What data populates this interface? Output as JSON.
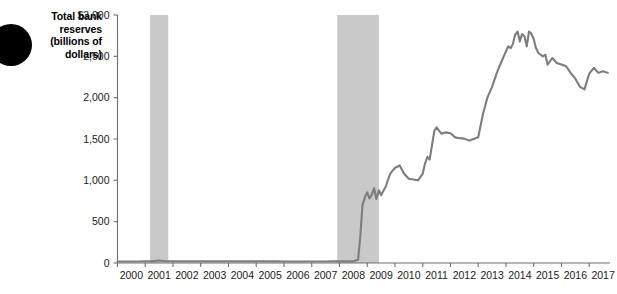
{
  "label": {
    "line1": "Total bank",
    "line2": "reserves",
    "line3": "(billions of",
    "line4": "dollars)",
    "full": "Total bank reserves (billions of dollars)"
  },
  "colors": {
    "line": "#7d7d7d",
    "recession_band": "#c9c9c9",
    "axis": "#6e6e6e",
    "bullet": "#000000",
    "text": "#1a1a1a"
  },
  "chart_data": {
    "type": "line",
    "title": "Total bank reserves (billions of dollars)",
    "xlabel": "",
    "ylabel": "Total bank reserves (billions of dollars)",
    "xlim": [
      2000,
      2017.75
    ],
    "ylim": [
      0,
      3000
    ],
    "grid": false,
    "legend": null,
    "ytick_labels": [
      "$3,000",
      "2,500",
      "2,000",
      "1,500",
      "1,000",
      "500",
      "0"
    ],
    "ytick_values": [
      3000,
      2500,
      2000,
      1500,
      1000,
      500,
      0
    ],
    "xtick_labels": [
      "2000",
      "2001",
      "2002",
      "2003",
      "2004",
      "2005",
      "2006",
      "2007",
      "2008",
      "2009",
      "2010",
      "2011",
      "2012",
      "2013",
      "2014",
      "2015",
      "2016",
      "2017"
    ],
    "xtick_values": [
      2000,
      2001,
      2002,
      2003,
      2004,
      2005,
      2006,
      2007,
      2008,
      2009,
      2010,
      2011,
      2012,
      2013,
      2014,
      2015,
      2016,
      2017
    ],
    "annotations": [
      {
        "name": "recession-2001",
        "type": "vspan",
        "x0": 2001.17,
        "x1": 2001.83,
        "label": "2001 recession"
      },
      {
        "name": "recession-2008",
        "type": "vspan",
        "x0": 2007.92,
        "x1": 2009.42,
        "label": "2007-2009 recession"
      }
    ],
    "series": [
      {
        "name": "Total bank reserves",
        "color": "#7d7d7d",
        "x": [
          2000.0,
          2000.25,
          2000.5,
          2000.75,
          2001.0,
          2001.25,
          2001.5,
          2001.75,
          2002.0,
          2002.25,
          2002.5,
          2002.75,
          2003.0,
          2003.25,
          2003.5,
          2003.75,
          2004.0,
          2004.25,
          2004.5,
          2004.75,
          2005.0,
          2005.25,
          2005.5,
          2005.75,
          2006.0,
          2006.25,
          2006.5,
          2006.75,
          2007.0,
          2007.25,
          2007.5,
          2007.75,
          2008.0,
          2008.25,
          2008.5,
          2008.67,
          2008.75,
          2008.83,
          2008.92,
          2009.0,
          2009.08,
          2009.17,
          2009.25,
          2009.33,
          2009.42,
          2009.5,
          2009.58,
          2009.67,
          2009.75,
          2009.83,
          2009.92,
          2010.0,
          2010.17,
          2010.33,
          2010.5,
          2010.67,
          2010.83,
          2011.0,
          2011.08,
          2011.17,
          2011.25,
          2011.42,
          2011.5,
          2011.67,
          2011.83,
          2012.0,
          2012.17,
          2012.33,
          2012.5,
          2012.67,
          2012.83,
          2013.0,
          2013.17,
          2013.33,
          2013.5,
          2013.67,
          2013.83,
          2014.0,
          2014.08,
          2014.17,
          2014.25,
          2014.33,
          2014.42,
          2014.5,
          2014.58,
          2014.67,
          2014.75,
          2014.83,
          2014.92,
          2015.0,
          2015.08,
          2015.17,
          2015.33,
          2015.42,
          2015.5,
          2015.67,
          2015.83,
          2016.0,
          2016.17,
          2016.33,
          2016.5,
          2016.67,
          2016.83,
          2017.0,
          2017.17,
          2017.33,
          2017.5,
          2017.67
        ],
        "y": [
          18,
          18,
          18,
          18,
          20,
          22,
          30,
          22,
          20,
          20,
          20,
          20,
          20,
          20,
          20,
          20,
          20,
          20,
          20,
          20,
          20,
          20,
          20,
          20,
          18,
          18,
          18,
          18,
          18,
          18,
          18,
          20,
          20,
          20,
          22,
          40,
          320,
          700,
          800,
          855,
          780,
          830,
          905,
          775,
          880,
          820,
          870,
          925,
          1010,
          1080,
          1120,
          1150,
          1180,
          1080,
          1020,
          1010,
          1000,
          1080,
          1200,
          1285,
          1250,
          1600,
          1640,
          1565,
          1580,
          1570,
          1520,
          1510,
          1505,
          1480,
          1500,
          1520,
          1800,
          2000,
          2130,
          2300,
          2430,
          2560,
          2620,
          2600,
          2650,
          2760,
          2800,
          2680,
          2770,
          2740,
          2620,
          2800,
          2770,
          2710,
          2600,
          2540,
          2500,
          2520,
          2400,
          2480,
          2420,
          2400,
          2380,
          2300,
          2230,
          2130,
          2100,
          2290,
          2360,
          2300,
          2320,
          2300
        ],
        "units": "billions of dollars"
      }
    ]
  }
}
